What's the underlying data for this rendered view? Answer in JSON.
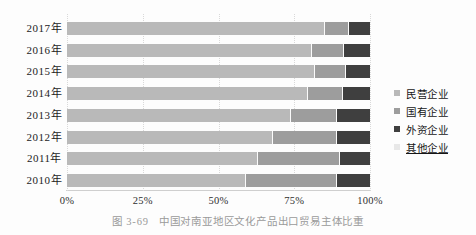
{
  "caption": {
    "label": "图 3-69",
    "title": "中国对南亚地区文化产品出口贸易主体比重"
  },
  "legend": {
    "position": "right",
    "items": [
      {
        "label": "民营企业",
        "swatch_color": "#b9b9b9",
        "underline": false
      },
      {
        "label": "国有企业",
        "swatch_color": "#9d9d9d",
        "underline": false
      },
      {
        "label": "外资企业",
        "swatch_color": "#3f3f3f",
        "underline": false
      },
      {
        "label": "其他企业",
        "swatch_color": "#e8e8e8",
        "underline": true
      }
    ]
  },
  "chart_data": {
    "type": "bar",
    "orientation": "horizontal",
    "stacked": true,
    "categories": [
      "2017年",
      "2016年",
      "2015年",
      "2014年",
      "2013年",
      "2012年",
      "2011年",
      "2010年"
    ],
    "series": [
      {
        "name": "民营企业",
        "color": "#b9b9b9",
        "values": [
          85,
          81,
          82,
          79.5,
          74,
          68,
          63,
          59
        ]
      },
      {
        "name": "国有企业",
        "color": "#9d9d9d",
        "values": [
          8,
          10.5,
          10,
          11.5,
          15,
          21,
          27,
          30
        ]
      },
      {
        "name": "外资企业",
        "color": "#3f3f3f",
        "values": [
          7,
          8.5,
          8,
          9,
          11,
          11,
          10,
          11
        ]
      },
      {
        "name": "其他企业",
        "color": "#e8e8e8",
        "values": [
          0,
          0,
          0,
          0,
          0,
          0,
          0,
          0
        ]
      }
    ],
    "xlabel": "",
    "ylabel": "",
    "xlim": [
      0,
      100
    ],
    "x_ticks": [
      "0%",
      "25%",
      "50%",
      "75%",
      "100%"
    ],
    "x_tick_values": [
      0,
      25,
      50,
      75,
      100
    ],
    "grid": "dotted-vertical",
    "legend_position": "right",
    "units": "percent"
  }
}
